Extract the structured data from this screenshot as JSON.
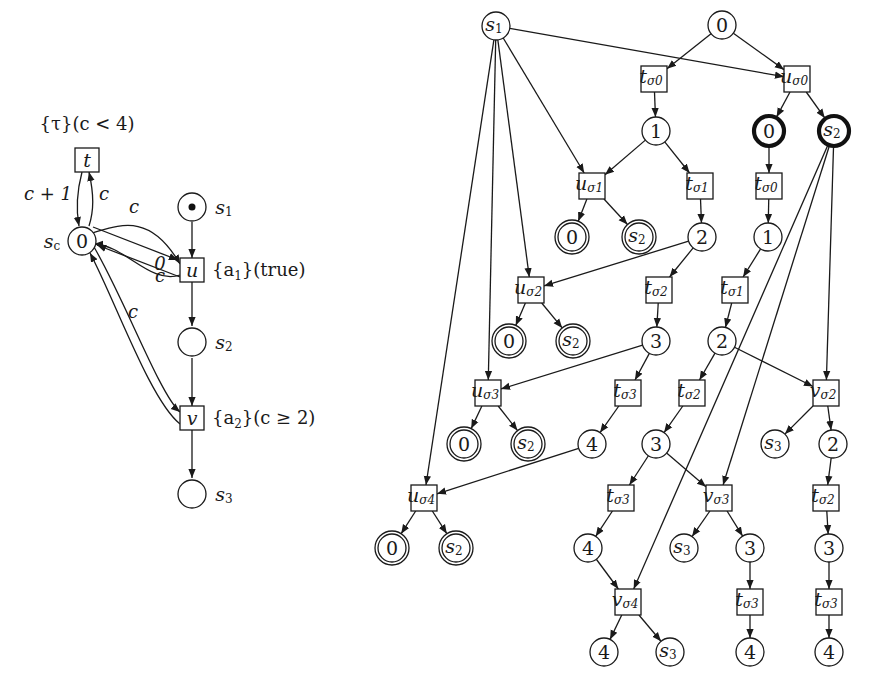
{
  "figure": {
    "left_net": {
      "title": "Petri net with counter place",
      "places": [
        {
          "id": "s1",
          "label": "s",
          "sub": "1",
          "x": 192,
          "y": 207,
          "token": true
        },
        {
          "id": "s2",
          "label": "s",
          "sub": "2",
          "x": 192,
          "y": 342,
          "token": false
        },
        {
          "id": "s3",
          "label": "s",
          "sub": "3",
          "x": 192,
          "y": 494,
          "token": false
        },
        {
          "id": "sc",
          "label": "s",
          "sub": "c",
          "x": 82,
          "y": 241,
          "value": "0"
        }
      ],
      "transitions": [
        {
          "id": "t",
          "label": "t",
          "x": 87,
          "y": 160,
          "annotation": "{τ}(c < 4)"
        },
        {
          "id": "u",
          "label": "u",
          "x": 192,
          "y": 270,
          "annotation_a": "{a",
          "annotation_sub": "1",
          "annotation_b": "}(true)"
        },
        {
          "id": "v",
          "label": "v",
          "x": 192,
          "y": 418,
          "annotation_a": "{a",
          "annotation_sub": "2",
          "annotation_b": "}(c ≥ 2)"
        }
      ],
      "arc_labels": {
        "sc_to_t": "c + 1",
        "t_to_sc": "c",
        "sc_to_u": "c",
        "u_to_sc": "0",
        "sc_to_v": "c",
        "v_to_sc": "c"
      }
    },
    "unfolding": {
      "title": "Branching process / unfolding",
      "nodes": [
        {
          "id": "n_s1",
          "type": "place",
          "label": "s",
          "sub": "1",
          "x": 496,
          "y": 26,
          "style": "normal"
        },
        {
          "id": "n_0",
          "type": "place",
          "label": "0",
          "x": 722,
          "y": 25,
          "style": "normal"
        },
        {
          "id": "t_s0",
          "type": "trans",
          "label": "t",
          "sub": "σ0",
          "x": 654,
          "y": 79
        },
        {
          "id": "u_s0",
          "type": "trans",
          "label": "u",
          "sub": "σ0",
          "x": 797,
          "y": 79
        },
        {
          "id": "n_1",
          "type": "place",
          "label": "1",
          "x": 656,
          "y": 131,
          "style": "normal"
        },
        {
          "id": "n_0b",
          "type": "place",
          "label": "0",
          "x": 769,
          "y": 131,
          "style": "thick"
        },
        {
          "id": "n_s2b",
          "type": "place",
          "label": "s",
          "sub": "2",
          "x": 834,
          "y": 131,
          "style": "thick"
        },
        {
          "id": "u_s1",
          "type": "trans",
          "label": "u",
          "sub": "σ1",
          "x": 592,
          "y": 186
        },
        {
          "id": "t_s1",
          "type": "trans",
          "label": "t",
          "sub": "σ1",
          "x": 700,
          "y": 186
        },
        {
          "id": "t_s0b",
          "type": "trans",
          "label": "t",
          "sub": "σ0",
          "x": 769,
          "y": 186
        },
        {
          "id": "d0_1",
          "type": "place",
          "label": "0",
          "x": 572,
          "y": 237,
          "style": "double"
        },
        {
          "id": "ds2_1",
          "type": "place",
          "label": "s",
          "sub": "2",
          "x": 639,
          "y": 237,
          "style": "double"
        },
        {
          "id": "n_2",
          "type": "place",
          "label": "2",
          "x": 702,
          "y": 237,
          "style": "normal"
        },
        {
          "id": "n_1b",
          "type": "place",
          "label": "1",
          "x": 768,
          "y": 237,
          "style": "normal"
        },
        {
          "id": "u_s2",
          "type": "trans",
          "label": "u",
          "sub": "σ2",
          "x": 531,
          "y": 290
        },
        {
          "id": "t_s2",
          "type": "trans",
          "label": "t",
          "sub": "σ2",
          "x": 659,
          "y": 290
        },
        {
          "id": "t_s1b",
          "type": "trans",
          "label": "t",
          "sub": "σ1",
          "x": 735,
          "y": 290
        },
        {
          "id": "d0_2",
          "type": "place",
          "label": "0",
          "x": 509,
          "y": 341,
          "style": "double"
        },
        {
          "id": "ds2_2",
          "type": "place",
          "label": "s",
          "sub": "2",
          "x": 573,
          "y": 341,
          "style": "double"
        },
        {
          "id": "n_3",
          "type": "place",
          "label": "3",
          "x": 656,
          "y": 341,
          "style": "normal"
        },
        {
          "id": "n_2b",
          "type": "place",
          "label": "2",
          "x": 722,
          "y": 341,
          "style": "normal"
        },
        {
          "id": "u_s3",
          "type": "trans",
          "label": "u",
          "sub": "σ3",
          "x": 488,
          "y": 393
        },
        {
          "id": "t_s3",
          "type": "trans",
          "label": "t",
          "sub": "σ3",
          "x": 628,
          "y": 393
        },
        {
          "id": "t_s2b",
          "type": "trans",
          "label": "t",
          "sub": "σ2",
          "x": 692,
          "y": 393
        },
        {
          "id": "v_s2",
          "type": "trans",
          "label": "v",
          "sub": "σ2",
          "x": 826,
          "y": 393
        },
        {
          "id": "d0_3",
          "type": "place",
          "label": "0",
          "x": 464,
          "y": 444,
          "style": "double"
        },
        {
          "id": "ds2_3",
          "type": "place",
          "label": "s",
          "sub": "2",
          "x": 528,
          "y": 444,
          "style": "double"
        },
        {
          "id": "n_4",
          "type": "place",
          "label": "4",
          "x": 592,
          "y": 444,
          "style": "normal"
        },
        {
          "id": "n_3b",
          "type": "place",
          "label": "3",
          "x": 656,
          "y": 444,
          "style": "normal"
        },
        {
          "id": "n_s3a",
          "type": "place",
          "label": "s",
          "sub": "3",
          "x": 775,
          "y": 444,
          "style": "normal"
        },
        {
          "id": "n_2c",
          "type": "place",
          "label": "2",
          "x": 833,
          "y": 444,
          "style": "normal"
        },
        {
          "id": "u_s4",
          "type": "trans",
          "label": "u",
          "sub": "σ4",
          "x": 424,
          "y": 498
        },
        {
          "id": "t_s3b",
          "type": "trans",
          "label": "t",
          "sub": "σ3",
          "x": 621,
          "y": 498
        },
        {
          "id": "v_s3",
          "type": "trans",
          "label": "v",
          "sub": "σ3",
          "x": 719,
          "y": 498
        },
        {
          "id": "t_s2c",
          "type": "trans",
          "label": "t",
          "sub": "σ2",
          "x": 826,
          "y": 498
        },
        {
          "id": "d0_4",
          "type": "place",
          "label": "0",
          "x": 392,
          "y": 548,
          "style": "double"
        },
        {
          "id": "ds2_4",
          "type": "place",
          "label": "s",
          "sub": "2",
          "x": 456,
          "y": 548,
          "style": "double"
        },
        {
          "id": "n_4b",
          "type": "place",
          "label": "4",
          "x": 588,
          "y": 548,
          "style": "normal"
        },
        {
          "id": "n_s3b",
          "type": "place",
          "label": "s",
          "sub": "3",
          "x": 684,
          "y": 548,
          "style": "normal"
        },
        {
          "id": "n_3c",
          "type": "place",
          "label": "3",
          "x": 750,
          "y": 548,
          "style": "normal"
        },
        {
          "id": "n_3d",
          "type": "place",
          "label": "3",
          "x": 829,
          "y": 548,
          "style": "normal"
        },
        {
          "id": "v_s4",
          "type": "trans",
          "label": "v",
          "sub": "σ4",
          "x": 628,
          "y": 602
        },
        {
          "id": "t_s3c",
          "type": "trans",
          "label": "t",
          "sub": "σ3",
          "x": 750,
          "y": 602
        },
        {
          "id": "t_s3d",
          "type": "trans",
          "label": "t",
          "sub": "σ3",
          "x": 829,
          "y": 602
        },
        {
          "id": "n_4c",
          "type": "place",
          "label": "4",
          "x": 604,
          "y": 652,
          "style": "normal"
        },
        {
          "id": "n_s3c",
          "type": "place",
          "label": "s",
          "sub": "3",
          "x": 670,
          "y": 652,
          "style": "normal"
        },
        {
          "id": "n_4d",
          "type": "place",
          "label": "4",
          "x": 750,
          "y": 652,
          "style": "normal"
        },
        {
          "id": "n_4e",
          "type": "place",
          "label": "4",
          "x": 829,
          "y": 652,
          "style": "normal"
        }
      ],
      "edges": [
        [
          "n_s1",
          "u_s0"
        ],
        [
          "n_s1",
          "u_s1"
        ],
        [
          "n_s1",
          "u_s2"
        ],
        [
          "n_s1",
          "u_s3"
        ],
        [
          "n_s1",
          "u_s4"
        ],
        [
          "n_0",
          "t_s0"
        ],
        [
          "n_0",
          "u_s0"
        ],
        [
          "t_s0",
          "n_1"
        ],
        [
          "u_s0",
          "n_0b"
        ],
        [
          "u_s0",
          "n_s2b"
        ],
        [
          "n_1",
          "u_s1"
        ],
        [
          "n_1",
          "t_s1"
        ],
        [
          "n_0b",
          "t_s0b"
        ],
        [
          "u_s1",
          "d0_1"
        ],
        [
          "u_s1",
          "ds2_1"
        ],
        [
          "t_s1",
          "n_2"
        ],
        [
          "t_s0b",
          "n_1b"
        ],
        [
          "n_2",
          "u_s2"
        ],
        [
          "n_2",
          "t_s2"
        ],
        [
          "n_1b",
          "t_s1b"
        ],
        [
          "u_s2",
          "d0_2"
        ],
        [
          "u_s2",
          "ds2_2"
        ],
        [
          "t_s2",
          "n_3"
        ],
        [
          "t_s1b",
          "n_2b"
        ],
        [
          "n_3",
          "u_s3"
        ],
        [
          "n_3",
          "t_s3"
        ],
        [
          "n_2b",
          "t_s2b"
        ],
        [
          "n_2b",
          "v_s2"
        ],
        [
          "n_s2b",
          "v_s2"
        ],
        [
          "n_s2b",
          "v_s3"
        ],
        [
          "n_s2b",
          "v_s4"
        ],
        [
          "u_s3",
          "d0_3"
        ],
        [
          "u_s3",
          "ds2_3"
        ],
        [
          "t_s3",
          "n_4"
        ],
        [
          "t_s2b",
          "n_3b"
        ],
        [
          "v_s2",
          "n_s3a"
        ],
        [
          "v_s2",
          "n_2c"
        ],
        [
          "n_4",
          "u_s4"
        ],
        [
          "n_3b",
          "t_s3b"
        ],
        [
          "n_3b",
          "v_s3"
        ],
        [
          "n_2c",
          "t_s2c"
        ],
        [
          "u_s4",
          "d0_4"
        ],
        [
          "u_s4",
          "ds2_4"
        ],
        [
          "t_s3b",
          "n_4b"
        ],
        [
          "v_s3",
          "n_s3b"
        ],
        [
          "v_s3",
          "n_3c"
        ],
        [
          "t_s2c",
          "n_3d"
        ],
        [
          "n_4b",
          "v_s4"
        ],
        [
          "n_3c",
          "t_s3c"
        ],
        [
          "n_3d",
          "t_s3d"
        ],
        [
          "v_s4",
          "n_4c"
        ],
        [
          "v_s4",
          "n_s3c"
        ],
        [
          "t_s3c",
          "n_4d"
        ],
        [
          "t_s3d",
          "n_4e"
        ]
      ]
    }
  }
}
